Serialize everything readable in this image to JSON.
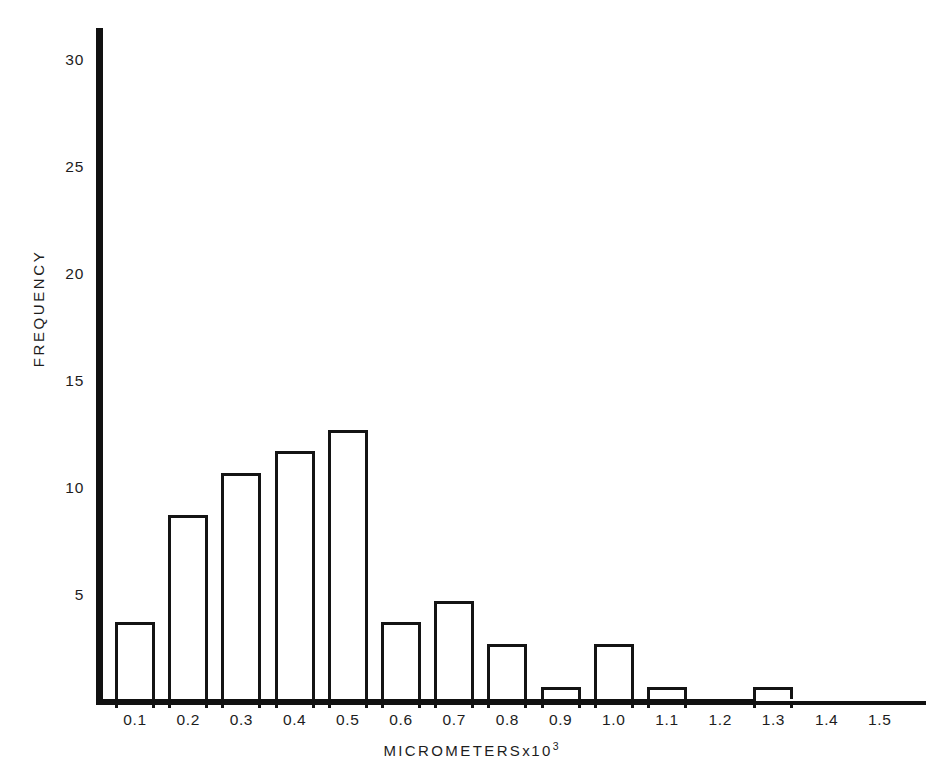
{
  "figure": {
    "background_color": "#ffffff",
    "ink_color": "#141414"
  },
  "axes": {
    "y": {
      "title": "FREQUENCY",
      "ticks": [
        5,
        10,
        15,
        20,
        25,
        30
      ],
      "tick_labels": [
        "5",
        "10",
        "15",
        "20",
        "25",
        "30"
      ],
      "range": [
        0,
        32
      ]
    },
    "x": {
      "title_text": "MICROMETERS",
      "title_times": "x",
      "title_base": "10",
      "title_exponent": "3",
      "tick_labels": [
        "0.1",
        "0.2",
        "0.3",
        "0.4",
        "0.5",
        "0.6",
        "0.7",
        "0.8",
        "0.9",
        "1.0",
        "1.1",
        "1.2",
        "1.3",
        "1.4",
        "1.5"
      ]
    }
  },
  "chart_data": {
    "type": "bar",
    "title": "",
    "subtitle": "",
    "xlabel": "MICROMETERS x 10^3",
    "ylabel": "FREQUENCY",
    "categories": [
      "0.1",
      "0.2",
      "0.3",
      "0.4",
      "0.5",
      "0.6",
      "0.7",
      "0.8",
      "0.9",
      "1.0",
      "1.1",
      "1.2",
      "1.3",
      "1.4",
      "1.5"
    ],
    "values": [
      4,
      9,
      11,
      12,
      13,
      4,
      5,
      3,
      1,
      3,
      1,
      0,
      1,
      0,
      0
    ],
    "ylim": [
      0,
      32
    ],
    "yticks": [
      5,
      10,
      15,
      20,
      25,
      30
    ],
    "grid": false,
    "legend": null,
    "bar_style": "outlined-hollow",
    "annotations": []
  }
}
